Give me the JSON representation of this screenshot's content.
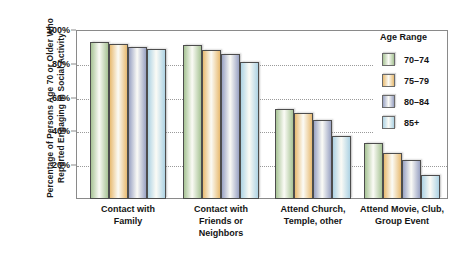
{
  "chart_data": {
    "type": "bar",
    "title": "",
    "xlabel": "",
    "ylabel": "Percentage of Persons Age 70 or Older Who Reported Engaging in Social Activity",
    "ylabel_lines": [
      "Percentage of Persons Age 70 or Older Who",
      "Reported Engaging in Social Activity"
    ],
    "ylim": [
      0,
      100
    ],
    "ytick_labels": [
      "100%",
      "80%",
      "60%",
      "40%",
      "20%"
    ],
    "ytick_values": [
      100,
      80,
      60,
      40,
      20
    ],
    "grid": true,
    "legend_position": "top-right",
    "legend_title": "Age Range",
    "categories": [
      "Contact with Family",
      "Contact with Friends or Neighbors",
      "Attend Church, Temple, other",
      "Attend Movie, Club, Group Event"
    ],
    "category_lines": [
      [
        "Contact with",
        "Family"
      ],
      [
        "Contact with",
        "Friends or",
        "Neighbors"
      ],
      [
        "Attend Church,",
        "Temple, other"
      ],
      [
        "Attend Movie, Club,",
        "Group Event"
      ]
    ],
    "series": [
      {
        "name": "70–74",
        "color": "#a8c496",
        "values": [
          93,
          91,
          53,
          33
        ]
      },
      {
        "name": "75–79",
        "color": "#e8bb72",
        "values": [
          92,
          88,
          51,
          27
        ]
      },
      {
        "name": "80–84",
        "color": "#9aa3c4",
        "values": [
          90,
          86,
          47,
          23
        ]
      },
      {
        "name": "85+",
        "color": "#aed3e4",
        "values": [
          89,
          81,
          37,
          14
        ]
      }
    ]
  },
  "colors": {
    "axis": "#8a8a8a",
    "grid": "#9a9a9a",
    "text": "#141414",
    "background": "#ffffff",
    "series_70_74": "#a8c496",
    "series_75_79": "#e8bb72",
    "series_80_84": "#9aa3c4",
    "series_85_plus": "#aed3e4"
  }
}
